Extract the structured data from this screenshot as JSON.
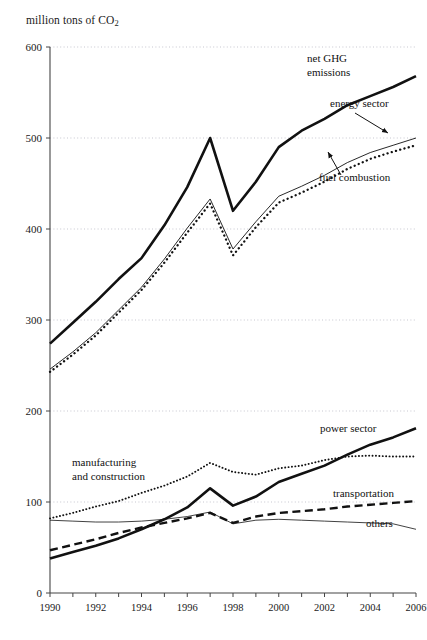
{
  "chart_data": {
    "type": "line",
    "title": "",
    "ylabel": "million tons of CO2",
    "ylabel_html": "million tons of CO₂",
    "xlabel": "",
    "ylim": [
      0,
      600
    ],
    "xlim": [
      1990,
      2006
    ],
    "yticks": [
      0,
      100,
      200,
      300,
      400,
      500,
      600
    ],
    "xticks": [
      1990,
      1991,
      1992,
      1993,
      1994,
      1995,
      1996,
      1997,
      1998,
      1999,
      2000,
      2001,
      2002,
      2003,
      2004,
      2005,
      2006
    ],
    "xtick_labels": [
      "1990",
      "1992",
      "1994",
      "1996",
      "1998",
      "2000",
      "2002",
      "2004",
      "2006"
    ],
    "grid": "horizontal-dotted",
    "legend": "inline-annotations",
    "x": [
      1990,
      1991,
      1992,
      1993,
      1994,
      1995,
      1996,
      1997,
      1998,
      1999,
      2000,
      2001,
      2002,
      2003,
      2004,
      2005,
      2006
    ],
    "series": [
      {
        "name": "net GHG emissions",
        "style": "thick-solid",
        "values": [
          274,
          297,
          320,
          345,
          368,
          404,
          446,
          500,
          420,
          452,
          490,
          508,
          521,
          536,
          546,
          556,
          568
        ]
      },
      {
        "name": "energy sector",
        "style": "thin-solid",
        "values": [
          246,
          265,
          286,
          311,
          336,
          367,
          401,
          433,
          378,
          408,
          436,
          447,
          459,
          473,
          484,
          492,
          500
        ]
      },
      {
        "name": "fuel combustion",
        "style": "dotted-bold",
        "values": [
          243,
          262,
          283,
          308,
          333,
          363,
          396,
          428,
          371,
          402,
          429,
          440,
          452,
          466,
          477,
          485,
          492
        ]
      },
      {
        "name": "manufacturing and construction",
        "style": "dotted",
        "values": [
          82,
          88,
          95,
          101,
          110,
          118,
          128,
          143,
          133,
          130,
          137,
          140,
          146,
          150,
          151,
          150,
          150
        ]
      },
      {
        "name": "power sector",
        "style": "thick-solid",
        "values": [
          38,
          45,
          52,
          60,
          70,
          81,
          94,
          115,
          96,
          106,
          122,
          131,
          140,
          152,
          163,
          171,
          181
        ]
      },
      {
        "name": "transportation",
        "style": "dashed",
        "values": [
          47,
          53,
          59,
          66,
          72,
          77,
          82,
          88,
          77,
          84,
          88,
          90,
          92,
          95,
          97,
          99,
          101
        ]
      },
      {
        "name": "others",
        "style": "thin-solid-light",
        "values": [
          80,
          79,
          78,
          78,
          79,
          81,
          84,
          89,
          76,
          80,
          81,
          80,
          79,
          78,
          77,
          76,
          70
        ]
      }
    ],
    "annotations": [
      {
        "id": "net-ghg-emissions",
        "line1": "net GHG",
        "line2": "emissions",
        "arrow": false
      },
      {
        "id": "energy-sector",
        "line1": "energy sector",
        "line2": "",
        "arrow": true
      },
      {
        "id": "fuel-combustion",
        "line1": "fuel combustion",
        "line2": "",
        "arrow": true
      },
      {
        "id": "manufacturing-and-construction",
        "line1": "manufacturing",
        "line2": "and construction",
        "arrow": false
      },
      {
        "id": "power-sector",
        "line1": "power sector",
        "line2": "",
        "arrow": false
      },
      {
        "id": "transportation",
        "line1": "transportation",
        "line2": "",
        "arrow": false
      },
      {
        "id": "others",
        "line1": "others",
        "line2": "",
        "arrow": false
      }
    ],
    "colors": {
      "line": "#111111",
      "grid": "#b9b9c4",
      "axis": "#444444",
      "text": "#1a1a1a"
    }
  }
}
